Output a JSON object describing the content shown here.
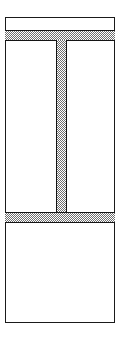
{
  "figure": {
    "canvas": {
      "width_px": 126,
      "height_px": 347,
      "background_color": "#ffffff"
    },
    "colors": {
      "line": "#1a1a1a",
      "hatch_dot": "#6e6e6e",
      "hatch_ground": "#ffffff",
      "fill": "#ffffff"
    },
    "geometry": {
      "outer_frame": {
        "x": 5,
        "y": 17,
        "width": 110,
        "height": 306
      },
      "flange_top": {
        "x": 5,
        "y": 30,
        "width": 110,
        "height": 11
      },
      "flange_bottom": {
        "x": 5,
        "y": 212,
        "width": 110,
        "height": 11
      },
      "web_stem": {
        "x": 56,
        "y": 40,
        "width": 11,
        "height": 173
      }
    },
    "regions": [
      {
        "name": "head-void",
        "label": ""
      },
      {
        "name": "left-cavity",
        "label": ""
      },
      {
        "name": "right-cavity",
        "label": ""
      },
      {
        "name": "base-cavity",
        "label": ""
      }
    ],
    "hatch_pattern": {
      "style": "checkerboard-stipple",
      "cell_px": 2
    }
  }
}
